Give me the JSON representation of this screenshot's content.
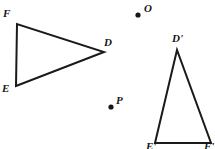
{
  "figure": {
    "type": "geometry-diagram",
    "width": 215,
    "height": 149,
    "background_color": "#ffffff",
    "stroke_color": "#1a1a1a",
    "stroke_width": 2,
    "label_color": "#161616"
  },
  "shapes": {
    "triangle_original": {
      "name": "triangle-def",
      "vertices": [
        {
          "label": "D",
          "x": 104,
          "y": 52,
          "label_x": 104,
          "label_y": 37
        },
        {
          "label": "E",
          "x": 16,
          "y": 86,
          "label_x": 2,
          "label_y": 83
        },
        {
          "label": "F",
          "x": 17,
          "y": 24,
          "label_x": 3,
          "label_y": 8
        }
      ]
    },
    "triangle_image": {
      "name": "triangle-def-prime",
      "vertices": [
        {
          "label": "D'",
          "x": 177,
          "y": 50,
          "label_x": 172,
          "label_y": 33
        },
        {
          "label": "E'",
          "x": 155,
          "y": 143,
          "label_x": 146,
          "label_y": 141
        },
        {
          "label": "F'",
          "x": 211,
          "y": 143,
          "label_x": 204,
          "label_y": 141
        }
      ]
    }
  },
  "points": [
    {
      "label": "O",
      "name": "point-o",
      "x": 138,
      "y": 15,
      "label_x": 144,
      "label_y": 3
    },
    {
      "label": "P",
      "name": "point-p",
      "x": 111,
      "y": 107,
      "label_x": 116,
      "label_y": 95
    }
  ]
}
